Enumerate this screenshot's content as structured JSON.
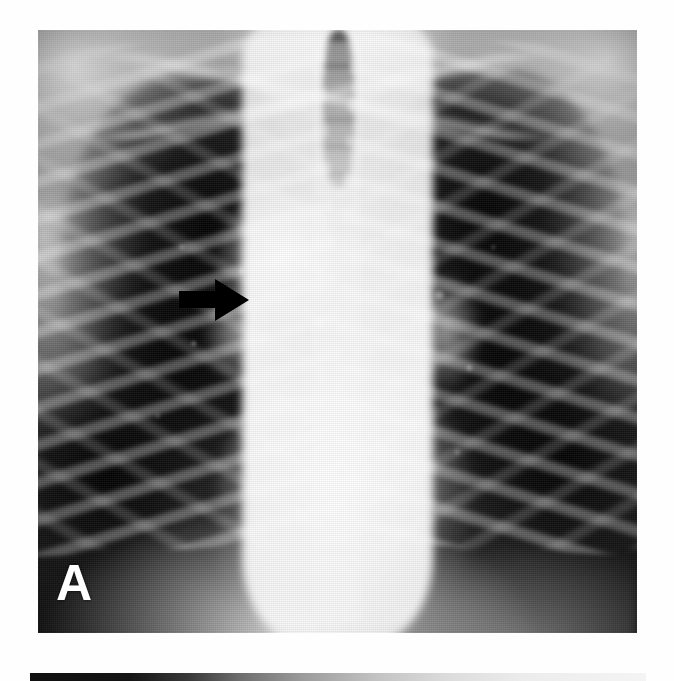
{
  "figure": {
    "type": "medical-radiograph-figure",
    "modality": "chest-radiograph",
    "view": "posteroanterior",
    "panel_count_visible": 2,
    "background_color": "#fefefe"
  },
  "panel_a": {
    "label": "A",
    "label_color": "#ffffff",
    "label_position": "bottom-left",
    "image_kind": "chest-x-ray",
    "frame": {
      "left": 38,
      "top": 30,
      "width": 599,
      "height": 603
    },
    "tones": {
      "film_black": "#0a0a0a",
      "lung_field": "#141414",
      "soft_tissue": "#b8b8b8",
      "mediastinum_white": "#f2f2f2",
      "bone_white": "#ffffff"
    },
    "anatomy_regions": [
      {
        "name": "right-lung-field",
        "tone": "dark",
        "note": "aerated, rib shadows visible"
      },
      {
        "name": "left-lung-field",
        "tone": "dark",
        "note": "aerated, rib shadows visible"
      },
      {
        "name": "mediastinum",
        "tone": "opaque-white",
        "note": "markedly widened central column"
      },
      {
        "name": "trachea",
        "tone": "grey-air-column",
        "note": "midline, upper third"
      },
      {
        "name": "thoracic-spine",
        "tone": "grey-white",
        "note": "midline vertebral column"
      },
      {
        "name": "cardiac-silhouette",
        "tone": "white",
        "note": "enlarged lower mediastinal border"
      },
      {
        "name": "diaphragm",
        "tone": "white",
        "note": "bilateral domes at lower margin"
      },
      {
        "name": "clavicles",
        "tone": "white",
        "note": "upper thorax"
      },
      {
        "name": "right-hilum",
        "tone": "grey-white"
      },
      {
        "name": "left-hilum",
        "tone": "grey-white"
      },
      {
        "name": "costophrenic-angles",
        "tone": "black"
      }
    ]
  },
  "annotations": [
    {
      "kind": "arrow",
      "name": "mediastinal-widening-arrow",
      "color": "#000000",
      "direction": "right",
      "position": {
        "left": 179,
        "top": 277,
        "width": 72,
        "height": 46
      },
      "points_at": "right-paratracheal-mediastinal-border"
    }
  ],
  "panel_b": {
    "label": "B",
    "visible_fraction": "top-edge-sliver-only",
    "frame": {
      "left": 30,
      "top": 673,
      "width": 616,
      "height": 8
    }
  }
}
